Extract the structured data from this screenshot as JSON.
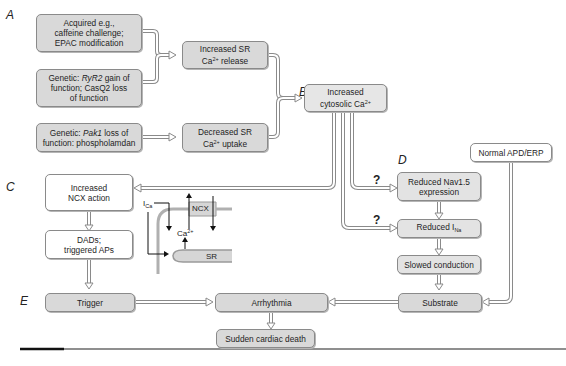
{
  "section_labels": {
    "a": "A",
    "b": "B",
    "c": "C",
    "d": "D",
    "e": "E"
  },
  "boxes": {
    "acquired": {
      "line1": "Acquired e.g.,",
      "line2": "caffeine challenge;",
      "line3": "EPAC modification"
    },
    "genetic_ryr2": {
      "pre": "Genetic: ",
      "gene": "RyR2",
      "post1": " gain of",
      "line2": "function; CasQ2 loss",
      "line3": "of function"
    },
    "genetic_pak1": {
      "pre": "Genetic: ",
      "gene": "Pak1",
      "post1": " loss of",
      "line2": "function: phospholamdan"
    },
    "inc_sr_release": {
      "line1": "Increased SR",
      "ca": "Ca",
      "charge": "2+",
      "rest": " release"
    },
    "dec_sr_uptake": {
      "line1": "Decreased SR",
      "ca": "Ca",
      "charge": "2+",
      "rest": " uptake"
    },
    "inc_cytosolic": {
      "line1": "Increased",
      "line2a": "cytosolic Ca",
      "charge": "2+"
    },
    "inc_ncx": {
      "line1": "Increased",
      "line2": "NCX action"
    },
    "dads": {
      "line1": "DADs;",
      "line2": "triggered APs"
    },
    "reduced_nav": {
      "line1": "Reduced Nav1.5",
      "line2": "expression"
    },
    "reduced_ina": {
      "main": "Reduced I",
      "sub": "Na"
    },
    "slowed": {
      "label": "Slowed conduction"
    },
    "normal_apd": {
      "label": "Normal APD/ERP"
    },
    "trigger": {
      "label": "Trigger"
    },
    "arrhythmia": {
      "label": "Arrhythmia"
    },
    "substrate": {
      "label": "Substrate"
    },
    "scd": {
      "label": "Sudden cardiac death"
    }
  },
  "question_mark": "?",
  "inset": {
    "ica_main": "I",
    "ica_sub": "Ca",
    "ncx": "NCX",
    "ca": "Ca",
    "charge": "2+",
    "sr": "SR"
  },
  "colors": {
    "box_gray": "#d9d9d9",
    "arrow_outline": "#8a8a8a",
    "rule": "#555555"
  }
}
